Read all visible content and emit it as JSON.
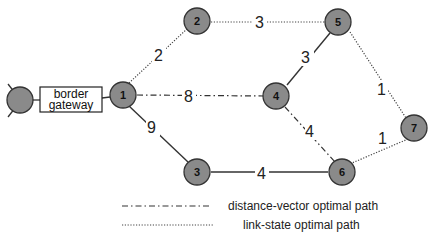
{
  "diagram": {
    "title": "",
    "colors": {
      "node_fill": "#8a8a8a",
      "node_stroke": "#333333",
      "line": "#333333",
      "text": "#222222"
    },
    "border_gateway": {
      "label_line1": "border",
      "label_line2": "gateway"
    },
    "nodes": [
      {
        "id": "1",
        "label": "1"
      },
      {
        "id": "2",
        "label": "2"
      },
      {
        "id": "3",
        "label": "3"
      },
      {
        "id": "4",
        "label": "4"
      },
      {
        "id": "5",
        "label": "5"
      },
      {
        "id": "6",
        "label": "6"
      },
      {
        "id": "7",
        "label": "7"
      }
    ],
    "edges": [
      {
        "from": "1",
        "to": "2",
        "weight": "2",
        "style": "link-state"
      },
      {
        "from": "2",
        "to": "5",
        "weight": "3",
        "style": "link-state"
      },
      {
        "from": "1",
        "to": "4",
        "weight": "8",
        "style": "distance-vector"
      },
      {
        "from": "1",
        "to": "3",
        "weight": "9",
        "style": "solid"
      },
      {
        "from": "5",
        "to": "4",
        "weight": "3",
        "style": "solid"
      },
      {
        "from": "5",
        "to": "7",
        "weight": "1",
        "style": "link-state"
      },
      {
        "from": "4",
        "to": "6",
        "weight": "4",
        "style": "distance-vector"
      },
      {
        "from": "3",
        "to": "6",
        "weight": "4",
        "style": "solid"
      },
      {
        "from": "7",
        "to": "6",
        "weight": "1",
        "style": "link-state"
      }
    ],
    "legend": [
      {
        "style": "distance-vector",
        "label": "distance-vector optimal path"
      },
      {
        "style": "link-state",
        "label": "link-state optimal path"
      }
    ]
  }
}
